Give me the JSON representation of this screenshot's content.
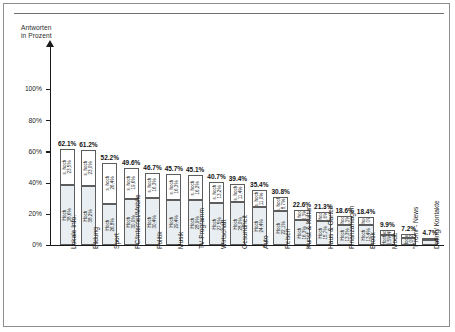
{
  "axis": {
    "title_line1": "Antworten",
    "title_line2": "in Prozent",
    "yticks": [
      "100%",
      "80%",
      "60%",
      "40%",
      "20%",
      "0%"
    ],
    "ymin": 0,
    "ymax": 110
  },
  "legend_terms": {
    "high": "Hoch",
    "very_high": "s. hoch"
  },
  "chart_data": {
    "type": "bar",
    "title": "",
    "xlabel": "",
    "ylabel": "Antworten in Prozent",
    "ylim": [
      0,
      110
    ],
    "grid": false,
    "stacked": true,
    "legend": [
      "Hoch",
      "s. hoch"
    ],
    "categories": [
      "Lokale Info.",
      "Bildung",
      "Sport",
      "PC/Internet/Mobile",
      "Politik",
      "Musik",
      "TV-Programm",
      "Wirtschaft",
      "Gesundheit",
      "Auto",
      "Reisen",
      "Kunst & Kultur",
      "Haus & Garten",
      "Finanzanlagen",
      "Erotik",
      "Mode",
      "\"Promi\"- News",
      "Dating/ Kontakte"
    ],
    "totals": [
      62.1,
      61.2,
      52.2,
      49.6,
      46.7,
      45.7,
      45.1,
      40.7,
      39.4,
      35.4,
      30.8,
      22.6,
      21.3,
      18.6,
      18.4,
      9.9,
      7.2,
      4.7
    ],
    "series": [
      {
        "name": "Hoch",
        "values": [
          38.6,
          38.2,
          26.8,
          30.0,
          30.4,
          29.4,
          28.9,
          27.5,
          28.0,
          24.4,
          22.1,
          16.3,
          15.7,
          13.3,
          13.4,
          6.5,
          5.0,
          3.5
        ]
      },
      {
        "name": "s. hoch",
        "values": [
          23.5,
          23.0,
          26.4,
          19.6,
          16.3,
          16.3,
          16.2,
          13.2,
          11.4,
          11.0,
          8.7,
          6.3,
          5.6,
          5.3,
          5.0,
          3.4,
          2.2,
          1.2
        ]
      }
    ],
    "bar_labels": [
      {
        "total": "62.1%",
        "shoch": "s. hoch\n23,5%",
        "hoch": "Hoch\n38,6%"
      },
      {
        "total": "61.2%",
        "shoch": "s. hoch\n23,0%",
        "hoch": "Hoch\n38,2%"
      },
      {
        "total": "52.2%",
        "shoch": "s. hoch\n26,4%",
        "hoch": "Hoch\n26,8%"
      },
      {
        "total": "49.6%",
        "shoch": "s. hoch\n19,6%",
        "hoch": "Hoch\n30,0%"
      },
      {
        "total": "46.7%",
        "shoch": "s. hoch\n16,3%",
        "hoch": "Hoch\n30,4%"
      },
      {
        "total": "45.7%",
        "shoch": "s. hoch\n16,3%",
        "hoch": "Hoch\n29,4%"
      },
      {
        "total": "45.1%",
        "shoch": "s. hoch\n16,2%",
        "hoch": "Hoch\n28,9%"
      },
      {
        "total": "40.7%",
        "shoch": "s. hoch\n13,2%",
        "hoch": "Hoch\n27,5%"
      },
      {
        "total": "39.4%",
        "shoch": "s. hoch\n11,4%",
        "hoch": "Hoch\n28,0%"
      },
      {
        "total": "35.4%",
        "shoch": "s. hoch\n11,0%",
        "hoch": "Hoch\n24,4%"
      },
      {
        "total": "30.8%",
        "shoch": "s. hoch\n8,7%",
        "hoch": "Hoch\n22,1%"
      },
      {
        "total": "22.6%",
        "shoch": "s. hoch\n6,3%",
        "hoch": "Hoch\n16,3%"
      },
      {
        "total": "21.3%",
        "shoch": "s. hoch\n5,6%",
        "hoch": "Hoch\n15,7%"
      },
      {
        "total": "18.6%",
        "shoch": "s. hoch\n5,3%",
        "hoch": "Hoch\n13,3%"
      },
      {
        "total": "18.4%",
        "shoch": "s. hoch\n5,0%",
        "hoch": "Hoch\n13,4%"
      },
      {
        "total": "9.9%",
        "shoch": "s. hoch\n3,4%",
        "hoch": "Hoch\n6,5%"
      },
      {
        "total": "7.2%",
        "shoch": "s. hoch\n2,2%",
        "hoch": "Hoch\n5,0%"
      },
      {
        "total": "4.7%",
        "shoch": "",
        "hoch": ""
      }
    ]
  },
  "colors": {
    "hoch_fill": "#e8eef1",
    "shoch_fill": "#ffffff",
    "stroke": "#5d5d5d",
    "axis": "#1a1a1a",
    "frame": "#8d8d8d"
  }
}
